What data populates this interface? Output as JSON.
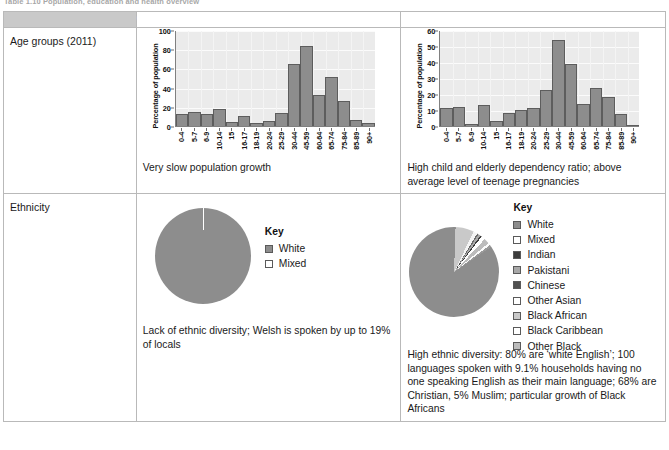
{
  "caption": "Table 1.10 Population, education and health overview",
  "table": {
    "header": {
      "row_label_blank": "",
      "columns": [
        "Gower",
        "Harpurhey"
      ]
    },
    "rows": [
      {
        "label": "Age groups (2011)"
      },
      {
        "label": "Ethnicity"
      }
    ]
  },
  "gower": {
    "age_description": "Very slow population growth",
    "ethnicity_description": "Lack of ethnic diversity; Welsh is spoken by up to 19% of locals",
    "key_title": "Key",
    "key_items": [
      {
        "label": "White",
        "color": "#8d8d8d"
      },
      {
        "label": "Mixed",
        "color": "#ffffff"
      }
    ]
  },
  "harpurhey": {
    "age_description": "High child and elderly dependency ratio; above average level of teenage pregnancies",
    "ethnicity_description": "High ethnic diversity: 80% are ‘white English’; 100 languages spoken with 9.1% households having no one speaking English as their main language; 68% are Christian, 5% Muslim; particular growth of Black Africans",
    "key_title": "Key",
    "key_items": [
      {
        "label": "White",
        "color": "#8d8d8d"
      },
      {
        "label": "Mixed",
        "color": "#ffffff"
      },
      {
        "label": "Indian",
        "color": "#3c3c3c"
      },
      {
        "label": "Pakistani",
        "color": "#a8a8a8"
      },
      {
        "label": "Chinese",
        "color": "#515151"
      },
      {
        "label": "Other Asian",
        "color": "#ffffff"
      },
      {
        "label": "Black African",
        "color": "#c9c9c9"
      },
      {
        "label": "Black Caribbean",
        "color": "#ffffff"
      },
      {
        "label": "Other Black",
        "color": "#bcbcbc"
      }
    ]
  },
  "chart_data": [
    {
      "type": "bar",
      "name": "gower-age-groups",
      "title": "",
      "xlabel": "",
      "ylabel": "Percentage of population",
      "ylim": [
        0,
        100
      ],
      "yticks": [
        0,
        20,
        40,
        60,
        80,
        100
      ],
      "grid": true,
      "categories": [
        "0-4",
        "5-7",
        "6-9",
        "10-14",
        "15",
        "16-17",
        "18-19",
        "20-24",
        "25-29",
        "30-44",
        "45-59",
        "60-64",
        "65-74",
        "75-84",
        "85-89",
        "90+"
      ],
      "values": [
        12,
        14.5,
        12,
        17.5,
        4.5,
        10.5,
        3.5,
        5.5,
        14,
        65,
        83,
        32,
        51,
        26,
        6.5,
        3
      ]
    },
    {
      "type": "bar",
      "name": "harpurhey-age-groups",
      "title": "",
      "xlabel": "",
      "ylabel": "Percentage of population",
      "ylim": [
        0,
        60
      ],
      "yticks": [
        0,
        10,
        20,
        30,
        40,
        50,
        60
      ],
      "grid": true,
      "categories": [
        "0-4",
        "5-7",
        "6-9",
        "10-14",
        "15",
        "16-17",
        "18-19",
        "20-24",
        "25-29",
        "30-44",
        "45-59",
        "60-64",
        "65-74",
        "75-84",
        "85-89",
        "90+"
      ],
      "values": [
        11,
        12,
        1,
        13,
        3,
        8,
        10,
        11,
        22.5,
        53.5,
        38.5,
        14,
        23.5,
        18,
        7.5,
        0.7
      ]
    },
    {
      "type": "pie",
      "name": "gower-ethnicity",
      "title": "",
      "labels": [
        "White",
        "Mixed"
      ],
      "values": [
        99.7,
        0.3
      ]
    },
    {
      "type": "pie",
      "name": "harpurhey-ethnicity",
      "title": "",
      "labels": [
        "White",
        "Mixed",
        "Indian",
        "Pakistani",
        "Chinese",
        "Other Asian",
        "Black African",
        "Black Caribbean",
        "Other Black"
      ],
      "values": [
        85.0,
        1.4,
        0.6,
        0.8,
        0.6,
        1.4,
        6.7,
        0.8,
        0.8
      ]
    }
  ]
}
